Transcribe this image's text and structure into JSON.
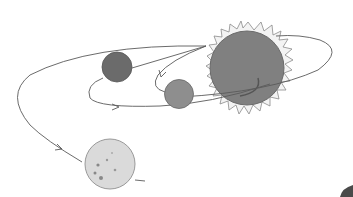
{
  "scene": {
    "description": "Pencil illustration of a sun with planets and curved orbit trajectories with arrows",
    "colors": {
      "background": "#ffffff",
      "sun_body": "#7f7f7f",
      "sun_rays_fill": "#f2f2f2",
      "sun_rays_stroke": "#8a8a8a",
      "planet_dark": "#6a6a6a",
      "planet_mid": "#8c8c8c",
      "planet_light": "#d8d8d8",
      "orbit_line": "#5a5a5a",
      "corner_blob": "#4a4a4a"
    },
    "objects": [
      "sun",
      "dark-planet",
      "middle-planet",
      "light-cratered-planet",
      "orbit-paths"
    ]
  }
}
